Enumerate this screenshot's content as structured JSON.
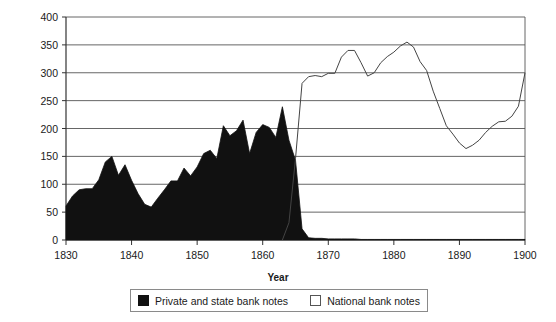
{
  "chart_data": {
    "type": "area",
    "title": "",
    "xlabel": "Year",
    "ylabel": "Millions of dollars",
    "xlim": [
      1830,
      1900
    ],
    "ylim": [
      0,
      400
    ],
    "grid": true,
    "legend_position": "bottom",
    "y_ticks": [
      0,
      50,
      100,
      150,
      200,
      250,
      300,
      350,
      400
    ],
    "x_ticks": [
      1830,
      1840,
      1850,
      1860,
      1870,
      1880,
      1890,
      1900
    ],
    "y_tick_labels": [
      "0",
      "50",
      "100",
      "150",
      "200",
      "250",
      "300",
      "350",
      "400"
    ],
    "x_tick_labels": [
      "1830",
      "1840",
      "1850",
      "1860",
      "1870",
      "1880",
      "1890",
      "1900"
    ],
    "series": [
      {
        "name": "Private and state bank notes",
        "style": "filled-area",
        "color": "#111111",
        "x": [
          1830,
          1831,
          1832,
          1833,
          1834,
          1835,
          1836,
          1837,
          1838,
          1839,
          1840,
          1841,
          1842,
          1843,
          1844,
          1845,
          1846,
          1847,
          1848,
          1849,
          1850,
          1851,
          1852,
          1853,
          1854,
          1855,
          1856,
          1857,
          1858,
          1859,
          1860,
          1861,
          1862,
          1863,
          1864,
          1865,
          1866,
          1867,
          1868,
          1869,
          1870,
          1871,
          1872,
          1873,
          1874,
          1875,
          1876,
          1877,
          1878,
          1879,
          1880,
          1881,
          1882,
          1883,
          1884,
          1885,
          1886,
          1887,
          1888,
          1889,
          1890,
          1891,
          1892,
          1893,
          1894,
          1895,
          1896,
          1897,
          1898,
          1899,
          1900
        ],
        "values": [
          61,
          79,
          90,
          92,
          92,
          108,
          140,
          150,
          116,
          135,
          107,
          83,
          64,
          59,
          75,
          90,
          106,
          106,
          129,
          115,
          131,
          155,
          161,
          146,
          205,
          187,
          196,
          215,
          155,
          193,
          207,
          202,
          184,
          239,
          179,
          143,
          20,
          4,
          3,
          3,
          2,
          2,
          2,
          2,
          2,
          1,
          1,
          1,
          1,
          1,
          1,
          1,
          1,
          1,
          1,
          1,
          1,
          1,
          1,
          1,
          1,
          1,
          1,
          1,
          1,
          1,
          1,
          1,
          1,
          1,
          1
        ]
      },
      {
        "name": "National bank notes",
        "style": "line",
        "color": "#444444",
        "x": [
          1863,
          1864,
          1865,
          1866,
          1867,
          1868,
          1869,
          1870,
          1871,
          1872,
          1873,
          1874,
          1875,
          1876,
          1877,
          1878,
          1879,
          1880,
          1881,
          1882,
          1883,
          1884,
          1885,
          1886,
          1887,
          1888,
          1889,
          1890,
          1891,
          1892,
          1893,
          1894,
          1895,
          1896,
          1897,
          1898,
          1899,
          1900
        ],
        "values": [
          0,
          31,
          146,
          281,
          293,
          295,
          293,
          299,
          299,
          328,
          340,
          340,
          318,
          294,
          300,
          318,
          329,
          337,
          348,
          355,
          346,
          320,
          304,
          267,
          236,
          205,
          190,
          174,
          164,
          170,
          179,
          193,
          204,
          212,
          213,
          222,
          240,
          300
        ]
      }
    ]
  },
  "axis": {
    "ylabel": "Millions of dollars",
    "xlabel": "Year"
  },
  "legend": {
    "items": [
      {
        "label": "Private and state bank notes",
        "swatch": "filled"
      },
      {
        "label": "National bank notes",
        "swatch": "hollow"
      }
    ]
  }
}
